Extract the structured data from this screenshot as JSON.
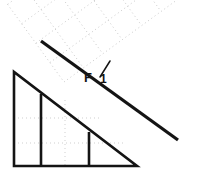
{
  "diagram": {
    "background_color": "#ffffff",
    "stroke_color": "#1a1a1a",
    "grid_color": "#c8c8c8",
    "labels": {
      "force_main": "F",
      "force_subscript": "1"
    },
    "triangle": {
      "name": "right-triangle-wedge",
      "apex": [
        14,
        72
      ],
      "bottom_left": [
        14,
        166
      ],
      "bottom_right": [
        137,
        166
      ],
      "internal_vertical_lines_x": [
        41,
        89
      ],
      "stroke_width": 2.6
    },
    "incline_line": {
      "name": "incline-surface-line",
      "start": [
        41,
        41
      ],
      "end": [
        178,
        140
      ],
      "stroke_width": 3.2
    },
    "force_arrow": {
      "name": "force-arrow",
      "start": [
        100,
        77
      ],
      "end": [
        110,
        62
      ],
      "stroke_width": 1.4
    },
    "inner_grid": {
      "horizontal_lines_y": [
        118,
        143
      ],
      "vertical_lines_x": [
        65
      ],
      "dash": "1,3"
    },
    "rotated_grid": {
      "rotation_deg": -36,
      "origin": [
        64,
        82
      ],
      "cell_size": 24,
      "cols": 6,
      "rows": 4,
      "dash": "1,3"
    }
  }
}
